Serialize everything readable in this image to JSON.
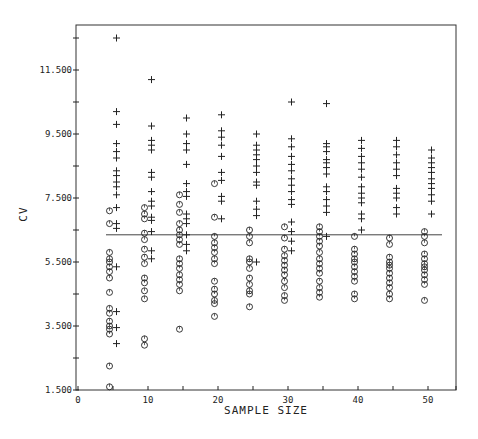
{
  "chart_data": {
    "type": "scatter",
    "title": "",
    "xlabel": "SAMPLE SIZE",
    "ylabel": "CV",
    "xlim": [
      0,
      54
    ],
    "ylim": [
      1.5,
      13.5
    ],
    "x_ticks": [
      0,
      10,
      20,
      30,
      40,
      50
    ],
    "x_minor_ticks": [
      5,
      15,
      25,
      35,
      45
    ],
    "y_ticks": [
      1.5,
      3.5,
      5.5,
      7.5,
      9.5,
      11.5
    ],
    "y_tick_labels": [
      "1.500",
      "3.500",
      "5.500",
      "7.500",
      "9.500",
      "11.500"
    ],
    "y_minor_ticks": [
      2.5,
      4.5,
      6.5,
      8.5,
      10.5,
      12.5
    ],
    "grid": false,
    "legend": null,
    "reference_line": {
      "y": 6.35,
      "x_from": 4,
      "x_to": 52
    },
    "series": [
      {
        "name": "circles",
        "marker": "circle",
        "points": [
          [
            4.5,
            7.1
          ],
          [
            4.5,
            6.7
          ],
          [
            4.5,
            5.8
          ],
          [
            4.5,
            5.6
          ],
          [
            4.5,
            5.5
          ],
          [
            4.5,
            5.35
          ],
          [
            4.5,
            5.2
          ],
          [
            4.5,
            5.0
          ],
          [
            4.5,
            4.55
          ],
          [
            4.5,
            4.05
          ],
          [
            4.5,
            3.9
          ],
          [
            4.5,
            3.65
          ],
          [
            4.5,
            3.5
          ],
          [
            4.5,
            3.4
          ],
          [
            4.5,
            3.25
          ],
          [
            4.5,
            2.25
          ],
          [
            4.5,
            1.6
          ],
          [
            9.5,
            7.2
          ],
          [
            9.5,
            7.0
          ],
          [
            9.5,
            6.85
          ],
          [
            9.5,
            6.4
          ],
          [
            9.5,
            6.2
          ],
          [
            9.5,
            5.9
          ],
          [
            9.5,
            5.65
          ],
          [
            9.5,
            5.45
          ],
          [
            9.5,
            5.0
          ],
          [
            9.5,
            4.85
          ],
          [
            9.5,
            4.6
          ],
          [
            9.5,
            4.35
          ],
          [
            9.5,
            3.1
          ],
          [
            9.5,
            2.9
          ],
          [
            14.5,
            7.6
          ],
          [
            14.5,
            7.3
          ],
          [
            14.5,
            7.05
          ],
          [
            14.5,
            6.7
          ],
          [
            14.5,
            6.5
          ],
          [
            14.5,
            6.35
          ],
          [
            14.5,
            6.2
          ],
          [
            14.5,
            6.05
          ],
          [
            14.5,
            5.6
          ],
          [
            14.5,
            5.45
          ],
          [
            14.5,
            5.3
          ],
          [
            14.5,
            5.1
          ],
          [
            14.5,
            4.95
          ],
          [
            14.5,
            4.8
          ],
          [
            14.5,
            4.6
          ],
          [
            14.5,
            3.4
          ],
          [
            19.5,
            7.95
          ],
          [
            19.5,
            6.9
          ],
          [
            19.5,
            6.3
          ],
          [
            19.5,
            6.1
          ],
          [
            19.5,
            5.95
          ],
          [
            19.5,
            5.8
          ],
          [
            19.5,
            5.6
          ],
          [
            19.5,
            5.45
          ],
          [
            19.5,
            4.9
          ],
          [
            19.5,
            4.65
          ],
          [
            19.5,
            4.5
          ],
          [
            19.5,
            4.3
          ],
          [
            19.5,
            4.2
          ],
          [
            19.5,
            3.8
          ],
          [
            24.5,
            6.5
          ],
          [
            24.5,
            6.3
          ],
          [
            24.5,
            6.1
          ],
          [
            24.5,
            5.6
          ],
          [
            24.5,
            5.5
          ],
          [
            24.5,
            5.3
          ],
          [
            24.5,
            5.0
          ],
          [
            24.5,
            4.8
          ],
          [
            24.5,
            4.6
          ],
          [
            24.5,
            4.5
          ],
          [
            24.5,
            4.1
          ],
          [
            29.5,
            6.6
          ],
          [
            29.5,
            6.25
          ],
          [
            29.5,
            5.9
          ],
          [
            29.5,
            5.7
          ],
          [
            29.5,
            5.55
          ],
          [
            29.5,
            5.4
          ],
          [
            29.5,
            5.25
          ],
          [
            29.5,
            5.1
          ],
          [
            29.5,
            4.9
          ],
          [
            29.5,
            4.7
          ],
          [
            29.5,
            4.45
          ],
          [
            29.5,
            4.3
          ],
          [
            34.5,
            6.6
          ],
          [
            34.5,
            6.45
          ],
          [
            34.5,
            6.3
          ],
          [
            34.5,
            6.15
          ],
          [
            34.5,
            6.0
          ],
          [
            34.5,
            5.8
          ],
          [
            34.5,
            5.6
          ],
          [
            34.5,
            5.45
          ],
          [
            34.5,
            5.3
          ],
          [
            34.5,
            5.15
          ],
          [
            34.5,
            4.9
          ],
          [
            34.5,
            4.7
          ],
          [
            34.5,
            4.55
          ],
          [
            34.5,
            4.4
          ],
          [
            39.5,
            6.3
          ],
          [
            39.5,
            5.9
          ],
          [
            39.5,
            5.75
          ],
          [
            39.5,
            5.6
          ],
          [
            39.5,
            5.5
          ],
          [
            39.5,
            5.35
          ],
          [
            39.5,
            5.2
          ],
          [
            39.5,
            5.05
          ],
          [
            39.5,
            4.9
          ],
          [
            39.5,
            4.5
          ],
          [
            39.5,
            4.35
          ],
          [
            44.5,
            6.25
          ],
          [
            44.5,
            6.05
          ],
          [
            44.5,
            5.65
          ],
          [
            44.5,
            5.5
          ],
          [
            44.5,
            5.4
          ],
          [
            44.5,
            5.3
          ],
          [
            44.5,
            5.15
          ],
          [
            44.5,
            5.0
          ],
          [
            44.5,
            4.85
          ],
          [
            44.5,
            4.7
          ],
          [
            44.5,
            4.5
          ],
          [
            44.5,
            4.35
          ],
          [
            49.5,
            6.45
          ],
          [
            49.5,
            6.3
          ],
          [
            49.5,
            6.1
          ],
          [
            49.5,
            5.75
          ],
          [
            49.5,
            5.6
          ],
          [
            49.5,
            5.45
          ],
          [
            49.5,
            5.35
          ],
          [
            49.5,
            5.25
          ],
          [
            49.5,
            5.1
          ],
          [
            49.5,
            4.95
          ],
          [
            49.5,
            4.8
          ],
          [
            49.5,
            4.3
          ]
        ]
      },
      {
        "name": "crosses",
        "marker": "plus",
        "points": [
          [
            5.5,
            12.5
          ],
          [
            5.5,
            10.2
          ],
          [
            5.5,
            9.8
          ],
          [
            5.5,
            9.2
          ],
          [
            5.5,
            8.95
          ],
          [
            5.5,
            8.75
          ],
          [
            5.5,
            8.35
          ],
          [
            5.5,
            8.2
          ],
          [
            5.5,
            8.0
          ],
          [
            5.5,
            7.85
          ],
          [
            5.5,
            7.6
          ],
          [
            5.5,
            7.2
          ],
          [
            5.5,
            6.7
          ],
          [
            5.5,
            6.55
          ],
          [
            5.5,
            5.35
          ],
          [
            5.5,
            3.95
          ],
          [
            5.5,
            3.45
          ],
          [
            5.5,
            2.95
          ],
          [
            10.5,
            11.2
          ],
          [
            10.5,
            9.75
          ],
          [
            10.5,
            9.3
          ],
          [
            10.5,
            9.15
          ],
          [
            10.5,
            9.0
          ],
          [
            10.5,
            8.3
          ],
          [
            10.5,
            8.15
          ],
          [
            10.5,
            7.7
          ],
          [
            10.5,
            7.4
          ],
          [
            10.5,
            7.25
          ],
          [
            10.5,
            6.9
          ],
          [
            10.5,
            6.8
          ],
          [
            10.5,
            6.45
          ],
          [
            10.5,
            5.85
          ],
          [
            10.5,
            5.6
          ],
          [
            15.5,
            10.0
          ],
          [
            15.5,
            9.5
          ],
          [
            15.5,
            9.2
          ],
          [
            15.5,
            9.0
          ],
          [
            15.5,
            8.55
          ],
          [
            15.5,
            7.95
          ],
          [
            15.5,
            7.7
          ],
          [
            15.5,
            7.55
          ],
          [
            15.5,
            7.0
          ],
          [
            15.5,
            6.85
          ],
          [
            15.5,
            6.7
          ],
          [
            15.5,
            6.35
          ],
          [
            15.5,
            6.05
          ],
          [
            15.5,
            5.85
          ],
          [
            20.5,
            10.1
          ],
          [
            20.5,
            9.6
          ],
          [
            20.5,
            9.4
          ],
          [
            20.5,
            9.15
          ],
          [
            20.5,
            8.8
          ],
          [
            20.5,
            8.3
          ],
          [
            20.5,
            8.05
          ],
          [
            20.5,
            7.55
          ],
          [
            20.5,
            7.4
          ],
          [
            20.5,
            6.85
          ],
          [
            25.5,
            9.5
          ],
          [
            25.5,
            9.15
          ],
          [
            25.5,
            9.0
          ],
          [
            25.5,
            8.85
          ],
          [
            25.5,
            8.7
          ],
          [
            25.5,
            8.5
          ],
          [
            25.5,
            8.3
          ],
          [
            25.5,
            8.0
          ],
          [
            25.5,
            7.9
          ],
          [
            25.5,
            7.4
          ],
          [
            25.5,
            7.15
          ],
          [
            25.5,
            6.95
          ],
          [
            25.5,
            5.5
          ],
          [
            30.5,
            10.5
          ],
          [
            30.5,
            9.35
          ],
          [
            30.5,
            9.1
          ],
          [
            30.5,
            8.8
          ],
          [
            30.5,
            8.55
          ],
          [
            30.5,
            8.35
          ],
          [
            30.5,
            8.1
          ],
          [
            30.5,
            7.9
          ],
          [
            30.5,
            7.7
          ],
          [
            30.5,
            7.45
          ],
          [
            30.5,
            7.3
          ],
          [
            30.5,
            6.75
          ],
          [
            30.5,
            6.45
          ],
          [
            30.5,
            6.15
          ],
          [
            30.5,
            5.85
          ],
          [
            35.5,
            10.45
          ],
          [
            35.5,
            9.2
          ],
          [
            35.5,
            9.1
          ],
          [
            35.5,
            8.95
          ],
          [
            35.5,
            8.7
          ],
          [
            35.5,
            8.6
          ],
          [
            35.5,
            8.45
          ],
          [
            35.5,
            8.25
          ],
          [
            35.5,
            7.85
          ],
          [
            35.5,
            7.7
          ],
          [
            35.5,
            7.45
          ],
          [
            35.5,
            7.25
          ],
          [
            35.5,
            7.05
          ],
          [
            35.5,
            6.3
          ],
          [
            40.5,
            9.3
          ],
          [
            40.5,
            9.05
          ],
          [
            40.5,
            8.8
          ],
          [
            40.5,
            8.6
          ],
          [
            40.5,
            8.4
          ],
          [
            40.5,
            8.15
          ],
          [
            40.5,
            7.85
          ],
          [
            40.5,
            7.65
          ],
          [
            40.5,
            7.5
          ],
          [
            40.5,
            7.35
          ],
          [
            40.5,
            7.0
          ],
          [
            40.5,
            6.85
          ],
          [
            40.5,
            6.5
          ],
          [
            45.5,
            9.3
          ],
          [
            45.5,
            9.1
          ],
          [
            45.5,
            8.85
          ],
          [
            45.5,
            8.6
          ],
          [
            45.5,
            8.4
          ],
          [
            45.5,
            8.2
          ],
          [
            45.5,
            7.8
          ],
          [
            45.5,
            7.65
          ],
          [
            45.5,
            7.5
          ],
          [
            45.5,
            7.2
          ],
          [
            45.5,
            7.0
          ],
          [
            50.5,
            9.0
          ],
          [
            50.5,
            8.75
          ],
          [
            50.5,
            8.6
          ],
          [
            50.5,
            8.45
          ],
          [
            50.5,
            8.3
          ],
          [
            50.5,
            8.1
          ],
          [
            50.5,
            7.95
          ],
          [
            50.5,
            7.8
          ],
          [
            50.5,
            7.6
          ],
          [
            50.5,
            7.4
          ],
          [
            50.5,
            7.0
          ]
        ]
      }
    ]
  },
  "colors": {
    "ink": "#222222",
    "frame": "#333333",
    "background": "#ffffff"
  }
}
